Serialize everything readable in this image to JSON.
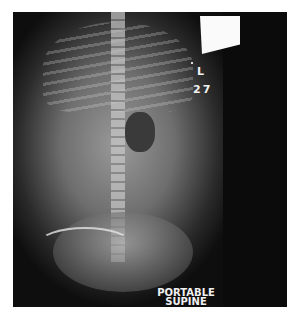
{
  "image": {
    "type": "radiograph",
    "view_labels": {
      "side_marker": "L",
      "number": "27",
      "caption_line1": "PORTABLE",
      "caption_line2": "SUPINE"
    },
    "colors": {
      "background": "#ffffff",
      "film": "#0b0b0b",
      "text": "#f0f0f0"
    }
  }
}
